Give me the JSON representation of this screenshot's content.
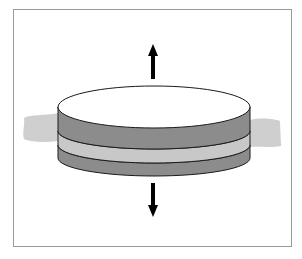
{
  "diagram": {
    "type": "layered-disk-separation",
    "layers": [
      {
        "name": "top-disk-face",
        "color": "#ffffff"
      },
      {
        "name": "upper-layer-side",
        "color": "#8c8c8c"
      },
      {
        "name": "middle-layer-side",
        "color": "#c8c8c8"
      },
      {
        "name": "lower-layer-side",
        "color": "#8c8c8c"
      }
    ],
    "background_band_color": "#cfcfcf",
    "arrows": [
      {
        "direction": "up",
        "color": "#000000"
      },
      {
        "direction": "down",
        "color": "#000000"
      }
    ],
    "frame_color": "#9a9a9a"
  }
}
